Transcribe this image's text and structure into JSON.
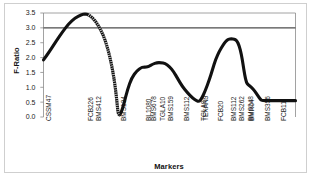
{
  "chart_data": {
    "type": "line",
    "title": "",
    "xlabel": "Markers",
    "ylabel": "F-Ratio",
    "ylim": [
      0.0,
      3.5
    ],
    "yticks": [
      "0.0",
      "0.5",
      "1.0",
      "1.5",
      "2.0",
      "2.5",
      "3.0",
      "3.5"
    ],
    "ytick_values": [
      0.0,
      0.5,
      1.0,
      1.5,
      2.0,
      2.5,
      3.0,
      3.5
    ],
    "grid": false,
    "legend": "none",
    "threshold_line": {
      "value": 3.0,
      "label": "significance threshold",
      "color": "#4d4d4d"
    },
    "line_color": "#111111",
    "categories": [
      "CSSM47",
      "FCB226",
      "BMS412",
      "BMS134",
      "BL1080",
      "BMS678",
      "TGLA10",
      "BMS159",
      "BMS112",
      "TGLA9",
      "TEXAN9",
      "FCB20",
      "BMS112",
      "BMS262",
      "BMS248",
      "BMR04",
      "BMS356",
      "FCB11"
    ],
    "categories_positions": [
      0.0,
      0.198,
      0.236,
      0.355,
      0.474,
      0.5,
      0.54,
      0.579,
      0.659,
      0.738,
      0.745,
      0.82,
      0.88,
      0.92,
      0.96,
      0.966,
      1.04,
      1.12
    ],
    "values": [
      1.92,
      3.47,
      2.6,
      0.05,
      1.68,
      1.7,
      1.83,
      1.8,
      1.05,
      0.52,
      0.58,
      1.95,
      2.63,
      2.58,
      1.1,
      1.05,
      0.55,
      0.55
    ],
    "curve_points": [
      [
        0.0,
        1.92
      ],
      [
        0.03,
        2.22
      ],
      [
        0.06,
        2.55
      ],
      [
        0.09,
        2.86
      ],
      [
        0.12,
        3.14
      ],
      [
        0.15,
        3.33
      ],
      [
        0.18,
        3.44
      ],
      [
        0.198,
        3.47
      ],
      [
        0.215,
        3.44
      ],
      [
        0.236,
        3.33
      ],
      [
        0.26,
        3.1
      ],
      [
        0.285,
        2.76
      ],
      [
        0.3,
        2.44
      ],
      [
        0.315,
        2.06
      ],
      [
        0.33,
        1.55
      ],
      [
        0.342,
        1.0
      ],
      [
        0.35,
        0.5
      ],
      [
        0.355,
        0.12
      ],
      [
        0.362,
        0.05
      ],
      [
        0.372,
        0.18
      ],
      [
        0.385,
        0.5
      ],
      [
        0.4,
        0.92
      ],
      [
        0.42,
        1.32
      ],
      [
        0.445,
        1.56
      ],
      [
        0.465,
        1.66
      ],
      [
        0.474,
        1.68
      ],
      [
        0.49,
        1.68
      ],
      [
        0.5,
        1.7
      ],
      [
        0.52,
        1.78
      ],
      [
        0.54,
        1.83
      ],
      [
        0.56,
        1.83
      ],
      [
        0.579,
        1.8
      ],
      [
        0.6,
        1.7
      ],
      [
        0.62,
        1.52
      ],
      [
        0.64,
        1.28
      ],
      [
        0.659,
        1.05
      ],
      [
        0.685,
        0.82
      ],
      [
        0.71,
        0.64
      ],
      [
        0.73,
        0.54
      ],
      [
        0.74,
        0.52
      ],
      [
        0.752,
        0.6
      ],
      [
        0.77,
        0.88
      ],
      [
        0.79,
        1.26
      ],
      [
        0.805,
        1.6
      ],
      [
        0.82,
        1.95
      ],
      [
        0.838,
        2.22
      ],
      [
        0.855,
        2.42
      ],
      [
        0.868,
        2.55
      ],
      [
        0.88,
        2.62
      ],
      [
        0.895,
        2.63
      ],
      [
        0.908,
        2.62
      ],
      [
        0.92,
        2.58
      ],
      [
        0.932,
        2.4
      ],
      [
        0.942,
        2.12
      ],
      [
        0.95,
        1.78
      ],
      [
        0.958,
        1.42
      ],
      [
        0.966,
        1.16
      ],
      [
        0.975,
        1.08
      ],
      [
        0.99,
        1.0
      ],
      [
        1.005,
        0.88
      ],
      [
        1.02,
        0.72
      ],
      [
        1.035,
        0.58
      ],
      [
        1.042,
        0.55
      ],
      [
        1.08,
        0.55
      ],
      [
        1.12,
        0.55
      ],
      [
        1.16,
        0.55
      ],
      [
        1.2,
        0.55
      ]
    ]
  },
  "axis": {
    "y_title": "F-Ratio",
    "x_title": "Markers"
  }
}
